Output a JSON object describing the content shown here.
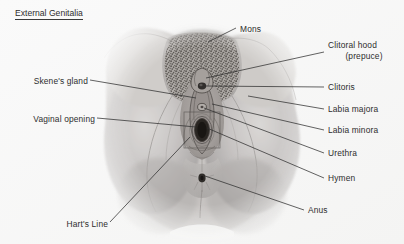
{
  "figure": {
    "title": "External Genitalia",
    "title_underlined": true,
    "background_color": "#f8f8f7",
    "ink_color": "#2d2d2d",
    "illustration": {
      "kind": "anatomical-pencil-drawing",
      "subject": "female external genitalia (vulva), frontal view",
      "description": "Grayscale graphite-style rendering of the vulva and surrounding thighs, with stippled pubic hair over the mons, central labial structures, and the anus below.",
      "bounds": {
        "x": 103,
        "y": 22,
        "width": 200,
        "height": 213
      }
    },
    "labels_left": [
      {
        "id": "skenes-gland",
        "text": "Skene's gland",
        "text_x": 88,
        "text_y": 82,
        "leader": [
          [
            90,
            80
          ],
          [
            196,
            98
          ]
        ]
      },
      {
        "id": "vaginal-opening",
        "text": "Vaginal opening",
        "text_x": 95,
        "text_y": 120,
        "leader": [
          [
            97,
            118
          ],
          [
            196,
            127
          ]
        ]
      },
      {
        "id": "harts-line",
        "text": "Hart's Line",
        "text_x": 108,
        "text_y": 225,
        "leader": [
          [
            110,
            222
          ],
          [
            190,
            137
          ]
        ]
      }
    ],
    "labels_right": [
      {
        "id": "mons",
        "text": "Mons",
        "text_x": 238,
        "text_y": 30,
        "leader": [
          [
            236,
            28
          ],
          [
            208,
            42
          ]
        ]
      },
      {
        "id": "clitoral-hood",
        "text": "Clitoral hood",
        "text2": "(prepuce)",
        "text_x": 327,
        "text_y": 50,
        "leader": [
          [
            324,
            52
          ],
          [
            206,
            78
          ]
        ]
      },
      {
        "id": "clitoris",
        "text": "Clitoris",
        "text_x": 327,
        "text_y": 88,
        "leader": [
          [
            324,
            87
          ],
          [
            205,
            86
          ]
        ]
      },
      {
        "id": "labia-majora",
        "text": "Labia majora",
        "text_x": 327,
        "text_y": 110,
        "leader": [
          [
            324,
            109
          ],
          [
            248,
            96
          ]
        ]
      },
      {
        "id": "labia-minora",
        "text": "Labia minora",
        "text_x": 327,
        "text_y": 131,
        "leader": [
          [
            324,
            130
          ],
          [
            212,
            104
          ]
        ]
      },
      {
        "id": "urethra",
        "text": "Urethra",
        "text_x": 327,
        "text_y": 154,
        "leader": [
          [
            324,
            153
          ],
          [
            204,
            108
          ]
        ]
      },
      {
        "id": "hymen",
        "text": "Hymen",
        "text_x": 327,
        "text_y": 179,
        "leader": [
          [
            324,
            178
          ],
          [
            207,
            128
          ]
        ]
      },
      {
        "id": "anus",
        "text": "Anus",
        "text_x": 307,
        "text_y": 211,
        "leader": [
          [
            304,
            210
          ],
          [
            205,
            176
          ]
        ]
      }
    ]
  }
}
